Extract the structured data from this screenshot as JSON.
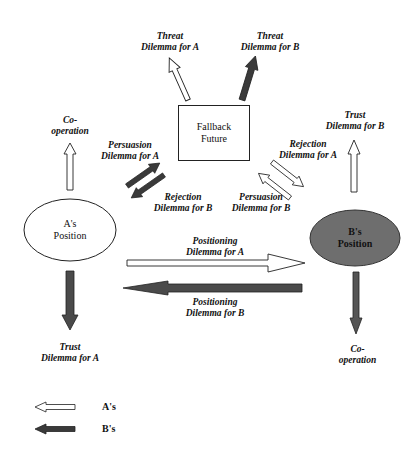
{
  "nodes": {
    "a_position": {
      "line1": "A's",
      "line2": "Position",
      "fill": "#ffffff"
    },
    "b_position": {
      "line1": "B's",
      "line2": "Position",
      "fill": "#6e6e6e"
    },
    "fallback": {
      "line1": "Fallback",
      "line2": "Future"
    }
  },
  "labels": {
    "threat_a": {
      "line1": "Threat",
      "line2": "Dilemma for A"
    },
    "threat_b": {
      "line1": "Threat",
      "line2": "Dilemma for B"
    },
    "coop_a": {
      "line1": "Co-",
      "line2": "operation"
    },
    "persuasion_a": {
      "line1": "Persuasion",
      "line2": "Dilemma for A"
    },
    "rejection_b": {
      "line1": "Rejection",
      "line2": "Dilemma for B"
    },
    "trust_b": {
      "line1": "Trust",
      "line2": "Dilemma for B"
    },
    "rejection_a": {
      "line1": "Rejection",
      "line2": "Dilemma for A"
    },
    "persuasion_b": {
      "line1": "Persuasion",
      "line2": "Dilemma for B"
    },
    "positioning_a": {
      "line1": "Positioning",
      "line2": "Dilemma for A"
    },
    "positioning_b": {
      "line1": "Positioning",
      "line2": "Dilemma for B"
    },
    "trust_a": {
      "line1": "Trust",
      "line2": "Dilemma for A"
    },
    "coop_b": {
      "line1": "Co-",
      "line2": "operation"
    }
  },
  "legend": {
    "a": {
      "label": "A's",
      "style": "white arrow"
    },
    "b": {
      "label": "B's",
      "style": "dark arrow"
    }
  },
  "colors": {
    "a_arrow": "#ffffff",
    "b_arrow": "#4a4a4a",
    "stroke": "#222222"
  }
}
